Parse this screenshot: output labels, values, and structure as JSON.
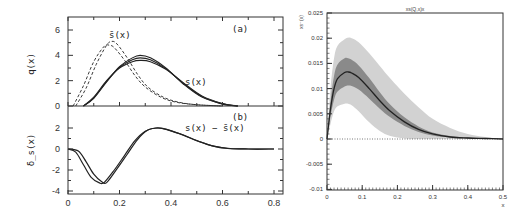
{
  "chart_data": [
    {
      "type": "line",
      "panel": "left-top",
      "xlabel": "",
      "ylabel": "q(x)",
      "xlim": [
        0,
        0.8
      ],
      "ylim": [
        0,
        7
      ],
      "yticks": [
        "0",
        "2",
        "4",
        "6"
      ],
      "annotations": [
        "(a)",
        "s̄(x)",
        "s(x)"
      ],
      "series": [
        {
          "name": "s̄(x) dashed 1",
          "style": "dashed",
          "x": [
            0.02,
            0.06,
            0.1,
            0.14,
            0.16,
            0.18,
            0.22,
            0.26,
            0.3,
            0.36,
            0.42,
            0.5,
            0.6
          ],
          "y": [
            0.0,
            1.6,
            3.5,
            4.7,
            4.8,
            4.6,
            3.6,
            2.4,
            1.5,
            0.7,
            0.3,
            0.1,
            0.0
          ]
        },
        {
          "name": "s̄(x) dashed 2",
          "style": "dashed",
          "x": [
            0.03,
            0.07,
            0.11,
            0.15,
            0.17,
            0.19,
            0.23,
            0.27,
            0.31,
            0.37,
            0.43,
            0.5,
            0.6
          ],
          "y": [
            0.0,
            1.4,
            3.3,
            4.8,
            5.1,
            4.9,
            3.8,
            2.5,
            1.5,
            0.7,
            0.3,
            0.1,
            0.0
          ]
        },
        {
          "name": "s(x) solid 1",
          "style": "solid",
          "x": [
            0.06,
            0.1,
            0.15,
            0.2,
            0.25,
            0.28,
            0.32,
            0.38,
            0.45,
            0.52,
            0.6,
            0.66
          ],
          "y": [
            0.0,
            0.6,
            1.9,
            3.1,
            3.8,
            4.0,
            3.8,
            3.0,
            1.7,
            0.7,
            0.15,
            0.0
          ]
        },
        {
          "name": "s(x) solid 2",
          "style": "solid",
          "x": [
            0.06,
            0.1,
            0.15,
            0.2,
            0.25,
            0.28,
            0.32,
            0.38,
            0.45,
            0.52,
            0.6,
            0.66
          ],
          "y": [
            0.0,
            0.7,
            2.0,
            3.0,
            3.5,
            3.6,
            3.5,
            2.9,
            1.8,
            0.8,
            0.2,
            0.0
          ]
        },
        {
          "name": "s(x) solid 3",
          "style": "solid",
          "x": [
            0.06,
            0.1,
            0.15,
            0.2,
            0.25,
            0.28,
            0.32,
            0.38,
            0.45,
            0.52,
            0.6,
            0.66
          ],
          "y": [
            0.0,
            0.65,
            1.95,
            3.05,
            3.65,
            3.8,
            3.65,
            2.95,
            1.75,
            0.75,
            0.17,
            0.0
          ]
        }
      ]
    },
    {
      "type": "line",
      "panel": "left-bottom",
      "xlabel": "",
      "ylabel": "δ_s(x)",
      "xlim": [
        0,
        0.8
      ],
      "ylim": [
        -4,
        3
      ],
      "xticks": [
        "0",
        "0.2",
        "0.4",
        "0.6",
        "0.8"
      ],
      "yticks": [
        "-4",
        "-2",
        "0",
        "2"
      ],
      "annotations": [
        "(b)",
        "s(x) − s̄(x)"
      ],
      "series": [
        {
          "name": "s(x)-s̄(x) 1",
          "style": "solid",
          "x": [
            0.0,
            0.03,
            0.06,
            0.09,
            0.12,
            0.14,
            0.18,
            0.22,
            0.26,
            0.3,
            0.34,
            0.38,
            0.44,
            0.5,
            0.56,
            0.62,
            0.7,
            0.8
          ],
          "y": [
            0.0,
            -0.3,
            -1.5,
            -2.7,
            -3.2,
            -3.2,
            -2.0,
            -0.6,
            0.8,
            1.7,
            2.0,
            1.9,
            1.4,
            0.8,
            0.3,
            0.05,
            0.0,
            0.0
          ]
        },
        {
          "name": "s(x)-s̄(x) 2",
          "style": "solid",
          "x": [
            0.0,
            0.04,
            0.07,
            0.1,
            0.13,
            0.15,
            0.19,
            0.23,
            0.27,
            0.31,
            0.35,
            0.39,
            0.45,
            0.51,
            0.57,
            0.63,
            0.7,
            0.8
          ],
          "y": [
            0.0,
            -0.2,
            -1.2,
            -2.4,
            -3.1,
            -3.2,
            -1.9,
            -0.5,
            0.9,
            1.8,
            2.0,
            1.8,
            1.3,
            0.7,
            0.25,
            0.05,
            0.0,
            0.0
          ]
        }
      ]
    },
    {
      "type": "area",
      "panel": "right",
      "title": "xs(Q,x)x",
      "xlabel": "x",
      "ylabel": "xs⁻(x)",
      "xlim": [
        0,
        0.5
      ],
      "ylim": [
        -0.01,
        0.025
      ],
      "xticks": [
        "0",
        "0.1",
        "0.2",
        "0.3",
        "0.4",
        "0.5"
      ],
      "yticks": [
        "-0.01",
        "-0.005",
        "0",
        "0.005",
        "0.01",
        "0.015",
        "0.02",
        "0.025"
      ],
      "x": [
        0.0,
        0.01,
        0.02,
        0.03,
        0.05,
        0.06,
        0.07,
        0.09,
        0.12,
        0.15,
        0.18,
        0.22,
        0.26,
        0.3,
        0.35,
        0.4,
        0.45,
        0.5
      ],
      "series": [
        {
          "name": "central",
          "values": [
            0.0,
            0.006,
            0.01,
            0.012,
            0.0132,
            0.0133,
            0.0131,
            0.0122,
            0.01,
            0.0076,
            0.0055,
            0.0034,
            0.0019,
            0.001,
            0.0004,
            0.0002,
            0.0001,
            0.0
          ]
        },
        {
          "name": "inner band upper",
          "values": [
            0.0,
            0.0075,
            0.0125,
            0.0148,
            0.016,
            0.016,
            0.0157,
            0.0146,
            0.0121,
            0.0093,
            0.0068,
            0.0043,
            0.0025,
            0.0013,
            0.0006,
            0.0003,
            0.0001,
            0.0
          ]
        },
        {
          "name": "inner band lower",
          "values": [
            0.0,
            0.0045,
            0.0078,
            0.0094,
            0.0104,
            0.0106,
            0.0105,
            0.0098,
            0.008,
            0.006,
            0.0043,
            0.0026,
            0.0014,
            0.0007,
            0.0003,
            0.0001,
            0.0,
            0.0
          ]
        },
        {
          "name": "outer band upper",
          "values": [
            0.0,
            0.01,
            0.016,
            0.0185,
            0.0198,
            0.0201,
            0.02,
            0.0192,
            0.017,
            0.0145,
            0.012,
            0.009,
            0.0063,
            0.004,
            0.0022,
            0.001,
            0.0004,
            0.0
          ]
        },
        {
          "name": "outer band lower",
          "values": [
            0.0,
            0.003,
            0.0055,
            0.0065,
            0.007,
            0.007,
            0.0067,
            0.0055,
            0.0033,
            0.0016,
            0.0006,
            0.0001,
            0.0,
            0.0,
            0.0,
            0.0,
            0.0,
            0.0
          ]
        },
        {
          "name": "zero line",
          "style": "dotted",
          "values": [
            0,
            0,
            0,
            0,
            0,
            0,
            0,
            0,
            0,
            0,
            0,
            0,
            0,
            0,
            0,
            0,
            0,
            0
          ]
        }
      ]
    }
  ],
  "labels": {
    "left_top_ylabel": "q(x)",
    "left_bottom_ylabel": "δ_s(x)",
    "panel_a": "(a)",
    "panel_b": "(b)",
    "sbar_label": "s̄(x)",
    "s_label": "s(x)",
    "diff_label": "s(x) − s̄(x)",
    "right_title": "xs(Q,x)x",
    "right_ylabel": "xs⁻(x)",
    "right_xlabel": "x"
  },
  "colors": {
    "line": "#222222",
    "outer_band": "#d2d2d2",
    "inner_band": "#8a8a8a",
    "axis": "#333333"
  }
}
